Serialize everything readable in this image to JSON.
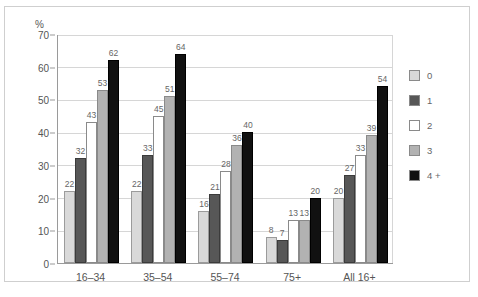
{
  "chart_data": {
    "type": "bar",
    "title": "",
    "subtitle": "",
    "xlabel": "",
    "ylabel": "%",
    "ylim": [
      0,
      70
    ],
    "ytick_step": 10,
    "yticks": [
      "70",
      "60",
      "50",
      "40",
      "30",
      "20",
      "10",
      "0"
    ],
    "grid": true,
    "legend_position": "right",
    "categories": [
      "16–34",
      "35–54",
      "55–74",
      "75+",
      "All 16+"
    ],
    "series": [
      {
        "name": "0",
        "color": "#d9d9d9",
        "values": [
          22,
          22,
          16,
          8,
          20
        ]
      },
      {
        "name": "1",
        "color": "#575757",
        "values": [
          32,
          33,
          21,
          7,
          27
        ]
      },
      {
        "name": "2",
        "color": "#ffffff",
        "values": [
          43,
          45,
          28,
          13,
          33
        ]
      },
      {
        "name": "3",
        "color": "#b2b2b2",
        "values": [
          53,
          51,
          36,
          13,
          39
        ]
      },
      {
        "name": "4 +",
        "color": "#111111",
        "values": [
          62,
          64,
          40,
          20,
          54
        ]
      }
    ]
  },
  "legend": {
    "items": [
      {
        "label": "0"
      },
      {
        "label": "1"
      },
      {
        "label": "2"
      },
      {
        "label": "3"
      },
      {
        "label": "4 +"
      }
    ]
  },
  "colors": {
    "series_0": "#d9d9d9",
    "series_1": "#575757",
    "series_2": "#ffffff",
    "series_3": "#b2b2b2",
    "series_4": "#111111",
    "gridline": "#d6d6d6",
    "axis": "#9a9a9a",
    "text": "#555555",
    "frame": "#cfcfcf"
  }
}
